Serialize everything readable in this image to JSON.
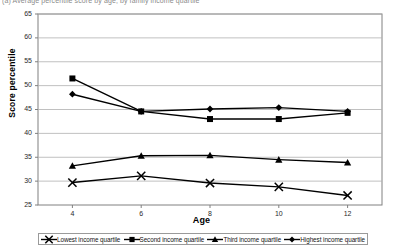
{
  "figure": {
    "caption": "(a) Average percentile score by age, by family income quartile",
    "plot_bg": "#ffffff",
    "line_color": "#000000",
    "grid_color": "#b0b0b0",
    "axis_color": "#808080"
  },
  "chart_data": {
    "type": "line",
    "title": "",
    "xlabel": "Age",
    "ylabel": "Score percentile",
    "x": [
      4,
      6,
      8,
      10,
      12
    ],
    "xticklabels": [
      "4",
      "6",
      "8",
      "10",
      "12"
    ],
    "xlim": [
      3,
      13
    ],
    "ylim": [
      25,
      65
    ],
    "yticks": [
      25,
      30,
      35,
      40,
      45,
      50,
      55,
      60,
      65
    ],
    "yticklabels": [
      "25",
      "30",
      "35",
      "40",
      "45",
      "50",
      "55",
      "60",
      "65"
    ],
    "grid": true,
    "grid_axis": "y",
    "legend_position": "bottom",
    "series": [
      {
        "name": "Lowest income quartile",
        "marker": "x",
        "values": [
          29.7,
          31.1,
          29.6,
          28.8,
          27.0
        ]
      },
      {
        "name": "Second income quartile",
        "marker": "square",
        "values": [
          51.5,
          44.6,
          43.0,
          43.0,
          44.3
        ]
      },
      {
        "name": "Third income quartile",
        "marker": "triangle",
        "values": [
          33.2,
          35.3,
          35.4,
          34.5,
          33.9
        ]
      },
      {
        "name": "Highest income quartile",
        "marker": "diamond",
        "values": [
          48.2,
          44.6,
          45.1,
          45.4,
          44.6
        ]
      }
    ]
  },
  "legend": {
    "items": [
      {
        "label": "Lowest income quartile",
        "marker": "x-marker-icon"
      },
      {
        "label": "Second income quartile",
        "marker": "square-marker-icon"
      },
      {
        "label": "Third income quartile",
        "marker": "triangle-marker-icon"
      },
      {
        "label": "Highest income quartile",
        "marker": "diamond-marker-icon"
      }
    ]
  }
}
